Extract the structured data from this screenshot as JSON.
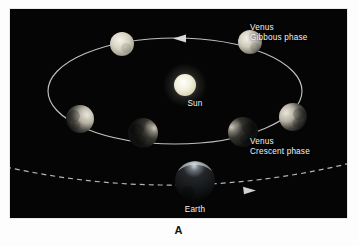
{
  "figure": {
    "caption": "A",
    "panel_background": "#050505",
    "page_background": "#ffffff",
    "label_color": "#f2f2f2"
  },
  "labels": {
    "gibbous": {
      "line1": "Venus",
      "line2": "Gibbous phase"
    },
    "crescent": {
      "line1": "Venus",
      "line2": "Crescent phase"
    },
    "sun": "Sun",
    "earth": "Earth"
  },
  "diagram": {
    "type": "orbital-phase-diagram",
    "central_body": {
      "name": "Sun",
      "cx": 175,
      "cy": 76,
      "r": 11,
      "color": "#f5f3e2"
    },
    "venus_orbit": {
      "cx": 165,
      "cy": 82,
      "rx": 127,
      "ry": 53,
      "stroke": "#d8d8d8",
      "direction": "counterclockwise",
      "arrow_label": "orbit-direction-arrow"
    },
    "earth_orbit": {
      "style": "dashed",
      "stroke": "#cfcfcf",
      "direction": "rightward",
      "arrow_label": "earth-orbit-arrow"
    },
    "earth": {
      "name": "Earth",
      "cx": 185,
      "cy": 172,
      "r": 20,
      "phase": "night-side",
      "lit_fraction": 0.08
    },
    "venus_positions": [
      {
        "id": "venus-superior-left",
        "name": "Venus full-ish",
        "cx": 112,
        "cy": 35,
        "r": 12,
        "lit_fraction": 0.95,
        "lit_side": "full",
        "phase": "near-full"
      },
      {
        "id": "venus-gibbous-right",
        "name": "Venus gibbous",
        "cx": 240,
        "cy": 33,
        "r": 12,
        "lit_fraction": 0.85,
        "lit_side": "full",
        "phase": "gibbous"
      },
      {
        "id": "venus-quarter-left",
        "name": "Venus quarter left",
        "cx": 70,
        "cy": 110,
        "r": 14,
        "lit_fraction": 0.42,
        "lit_side": "right",
        "phase": "quarter"
      },
      {
        "id": "venus-quarter-right",
        "name": "Venus quarter right",
        "cx": 283,
        "cy": 108,
        "r": 14,
        "lit_fraction": 0.42,
        "lit_side": "left",
        "phase": "quarter"
      },
      {
        "id": "venus-crescent-left",
        "name": "Venus crescent left",
        "cx": 133,
        "cy": 124,
        "r": 15,
        "lit_fraction": 0.18,
        "lit_side": "right",
        "phase": "crescent"
      },
      {
        "id": "venus-crescent-right",
        "name": "Venus crescent right",
        "cx": 233,
        "cy": 123,
        "r": 15,
        "lit_fraction": 0.18,
        "lit_side": "left",
        "phase": "crescent"
      }
    ]
  }
}
